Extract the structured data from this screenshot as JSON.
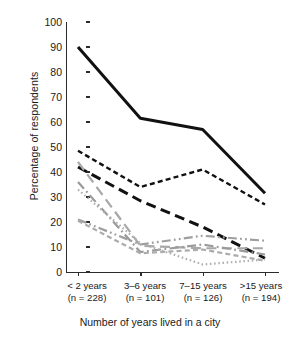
{
  "chart_data": {
    "type": "line",
    "title": "",
    "xlabel": "Number of years lived in a city",
    "ylabel": "Percentage of respondents",
    "categories": [
      "< 2 years",
      "3–6 years",
      "7–15 years",
      ">15 years"
    ],
    "category_sublabels": [
      "(n = 228)",
      "(n = 101)",
      "(n = 126)",
      "(n = 194)"
    ],
    "ylim": [
      0,
      100
    ],
    "ytick_values": [
      0,
      10,
      20,
      30,
      40,
      50,
      60,
      70,
      80,
      90,
      100
    ],
    "ytick_labels": [
      "0",
      "10",
      "20",
      "30",
      "40",
      "50",
      "60",
      "70",
      "80",
      "90",
      "100"
    ],
    "grid": false,
    "legend": "none",
    "series": [
      {
        "name": "series-1-solid-black",
        "color": "#111111",
        "dash": "solid",
        "width": 3.0,
        "values": [
          90.0,
          61.5,
          57.0,
          31.5
        ]
      },
      {
        "name": "series-2-short-dash-black",
        "color": "#111111",
        "dash": "short-dash",
        "width": 2.4,
        "values": [
          48.5,
          34.0,
          41.0,
          27.0
        ]
      },
      {
        "name": "series-3-long-dash-black",
        "color": "#111111",
        "dash": "long-dash",
        "width": 3.0,
        "values": [
          42.0,
          28.5,
          18.0,
          5.5
        ]
      },
      {
        "name": "series-4-long-dash-gray",
        "color": "#a8a8a8",
        "dash": "long-dash",
        "width": 2.2,
        "values": [
          44.0,
          10.5,
          9.5,
          9.5
        ]
      },
      {
        "name": "series-5-dash-dot-gray",
        "color": "#9a9a9a",
        "dash": "dash-dot",
        "width": 2.2,
        "values": [
          36.0,
          8.0,
          11.0,
          7.0
        ]
      },
      {
        "name": "series-6-dotted-gray",
        "color": "#b0b0b0",
        "dash": "dotted",
        "width": 2.2,
        "values": [
          33.0,
          11.5,
          3.0,
          5.0
        ]
      },
      {
        "name": "series-7-dash-dot-dot-gray",
        "color": "#9e9e9e",
        "dash": "dash-dot-dot",
        "width": 2.2,
        "values": [
          21.0,
          11.0,
          14.5,
          12.5
        ]
      },
      {
        "name": "series-8-short-dash-gray",
        "color": "#ababab",
        "dash": "short-dash",
        "width": 2.2,
        "values": [
          20.5,
          7.5,
          9.0,
          4.5
        ]
      }
    ]
  }
}
